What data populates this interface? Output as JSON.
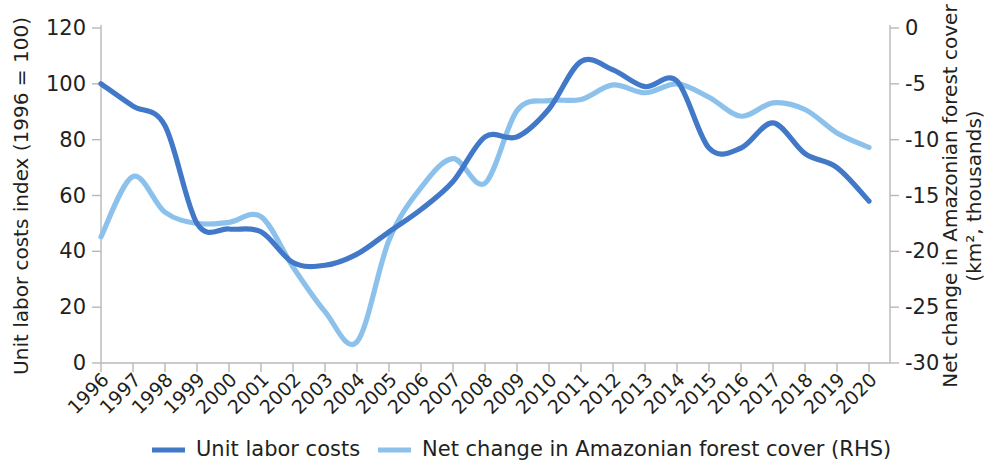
{
  "chart_data": {
    "type": "line",
    "title": "",
    "xlabel": "",
    "ylabel": "Unit labor costs index (1996 = 100)",
    "y2label": "Net change in Amazonian forest cover (km², thousands)",
    "grid": false,
    "legend_position": "bottom",
    "ylim": [
      0,
      120
    ],
    "y2lim": [
      -30,
      0
    ],
    "yticks": [
      "0",
      "20",
      "40",
      "60",
      "80",
      "100",
      "120"
    ],
    "ytick_values": [
      0,
      20,
      40,
      60,
      80,
      100,
      120
    ],
    "y2ticks": [
      "-30",
      "-25",
      "-20",
      "-15",
      "-10",
      "-5",
      "0"
    ],
    "y2tick_values": [
      -30,
      -25,
      -20,
      -15,
      -10,
      -5,
      0
    ],
    "categories": [
      "1996",
      "1997",
      "1998",
      "1999",
      "2000",
      "2001",
      "2002",
      "2003",
      "2004",
      "2005",
      "2006",
      "2007",
      "2008",
      "2009",
      "2010",
      "2011",
      "2012",
      "2013",
      "2014",
      "2015",
      "2016",
      "2017",
      "2018",
      "2019",
      "2020"
    ],
    "x": [
      1996,
      1997,
      1998,
      1999,
      2000,
      2001,
      2002,
      2003,
      2004,
      2005,
      2006,
      2007,
      2008,
      2009,
      2010,
      2011,
      2012,
      2013,
      2014,
      2015,
      2016,
      2017,
      2018,
      2019,
      2020
    ],
    "series": [
      {
        "name": "Unit labor costs",
        "axis": "left",
        "color": "#4178C8",
        "values": [
          100,
          92,
          85,
          50,
          48,
          47,
          36,
          35,
          39,
          47,
          55,
          65,
          81,
          81,
          91,
          108,
          105,
          99,
          101,
          77,
          77,
          86,
          75,
          70,
          58
        ]
      },
      {
        "name": "Net change in Amazonian forest cover (RHS)",
        "axis": "right",
        "color": "#8CC1EC",
        "values": [
          -18.7,
          -13.3,
          -16.5,
          -17.5,
          -17.4,
          -16.9,
          -21.4,
          -25.4,
          -28.1,
          -19.0,
          -14.3,
          -11.7,
          -13.9,
          -7.4,
          -6.5,
          -6.4,
          -5.1,
          -5.8,
          -5.0,
          -6.2,
          -7.9,
          -6.7,
          -7.3,
          -9.4,
          -10.7
        ]
      }
    ]
  },
  "legend": {
    "items": [
      {
        "label": "Unit labor costs",
        "color": "#4178C8"
      },
      {
        "label": "Net change in Amazonian forest cover (RHS)",
        "color": "#8CC1EC"
      }
    ]
  },
  "axes": {
    "left_title": "Unit labor costs index (1996 = 100)",
    "right_title_line1": "Net change in Amazonian forest cover",
    "right_title_line2": "(km², thousands)"
  }
}
